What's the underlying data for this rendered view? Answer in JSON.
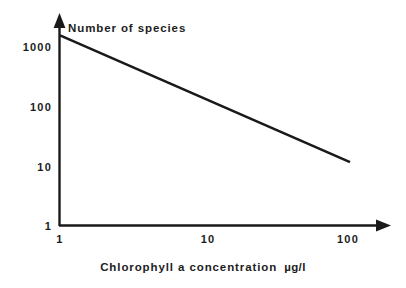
{
  "chart_data": {
    "type": "line",
    "title": "",
    "xlabel": "Chlorophyll a concentration  µg/l",
    "xlabel_text": "Chlorophyll a concentration",
    "xlabel_units": "µg/l",
    "ylabel": "Number of species",
    "xscale": "log",
    "yscale": "log",
    "xlim": [
      1,
      100
    ],
    "ylim": [
      1,
      1000
    ],
    "xticks": [
      "1",
      "10",
      "100"
    ],
    "xtick_values": [
      1,
      10,
      100
    ],
    "yticks": [
      "1000",
      "100",
      "10",
      "1"
    ],
    "ytick_values": [
      1000,
      100,
      10,
      1
    ],
    "grid": false,
    "legend": false,
    "series": [
      {
        "name": "Number of species",
        "x": [
          1,
          10,
          100
        ],
        "values": [
          700,
          80,
          9
        ]
      }
    ],
    "annotations": [],
    "line_color": "#1a1a1a",
    "axis_color": "#1a1a1a"
  },
  "axes": {
    "y_title": "Number of species",
    "x_title": "Chlorophyll a concentration",
    "x_units": "µg/l",
    "y_tick_1000": "1000",
    "y_tick_100": "100",
    "y_tick_10": "10",
    "y_tick_1": "1",
    "x_tick_1": "1",
    "x_tick_10": "10",
    "x_tick_100": "100"
  },
  "colors": {
    "background": "#ffffff",
    "ink": "#1a1a1a",
    "data_line": "#1a1a1a"
  }
}
